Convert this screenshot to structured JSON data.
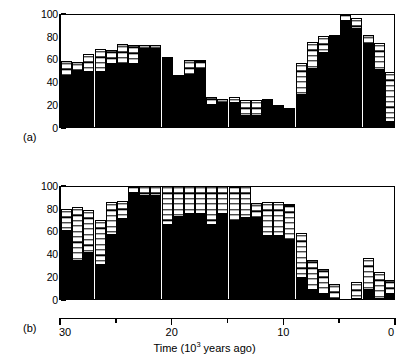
{
  "figure": {
    "axis_title_prefix": "Time (10",
    "axis_title_exponent": "3",
    "axis_title_suffix": " years ago)",
    "panel_a_tag": "(a)",
    "panel_b_tag": "(b)",
    "colors": {
      "solid": "#000000",
      "open": "#ffffff",
      "axis": "#000000",
      "background": "#ffffff"
    }
  },
  "chart_data": [
    {
      "type": "bar",
      "id": "panel-a",
      "title": "",
      "panel_label": "(a)",
      "xlabel": "Time (10^3 years ago)",
      "ylabel": "",
      "xlim": [
        30,
        0
      ],
      "ylim": [
        0,
        100
      ],
      "x_ticks_major": [
        30,
        20,
        10,
        0
      ],
      "x_ticks_minor": [
        25,
        15,
        5
      ],
      "y_ticks": [
        0,
        20,
        40,
        60,
        80,
        100
      ],
      "ytick_labels": [
        "0",
        "20",
        "40",
        "60",
        "80",
        "100"
      ],
      "grid": false,
      "legend": "none",
      "stacked": true,
      "bar_count": 30,
      "series": [
        {
          "name": "solid",
          "style": "filled-black",
          "values": [
            45,
            48,
            48,
            48,
            55,
            55,
            55,
            68,
            68,
            61,
            46,
            46,
            51,
            19,
            21,
            21,
            10,
            10,
            22,
            17,
            17,
            28,
            51,
            65,
            81,
            93,
            86,
            72,
            50,
            4
          ]
        },
        {
          "name": "open",
          "style": "white-with-horizontal-hatch",
          "values": [
            13,
            9,
            16,
            20,
            13,
            18,
            17,
            4,
            4,
            0,
            0,
            13,
            8,
            7,
            4,
            5,
            14,
            14,
            3,
            2,
            0,
            28,
            24,
            15,
            0,
            7,
            10,
            9,
            24,
            44
          ]
        },
        {
          "name": "total",
          "style": "stacked-top",
          "values": [
            58,
            57,
            64,
            68,
            68,
            73,
            72,
            72,
            72,
            61,
            46,
            59,
            59,
            26,
            25,
            26,
            24,
            24,
            25,
            19,
            17,
            56,
            75,
            80,
            81,
            100,
            96,
            81,
            74,
            48
          ]
        }
      ]
    },
    {
      "type": "bar",
      "id": "panel-b",
      "title": "",
      "panel_label": "(b)",
      "xlabel": "Time (10^3 years ago)",
      "ylabel": "",
      "xlim": [
        30,
        0
      ],
      "ylim": [
        0,
        100
      ],
      "x_ticks_major": [
        30,
        20,
        10,
        0
      ],
      "x_ticks_minor": [
        25,
        15,
        5
      ],
      "y_ticks": [
        0,
        20,
        40,
        60,
        80,
        100
      ],
      "ytick_labels": [
        "0",
        "20",
        "40",
        "60",
        "80",
        "100"
      ],
      "grid": false,
      "legend": "none",
      "stacked": true,
      "bar_count": 30,
      "series": [
        {
          "name": "solid",
          "style": "filled-black",
          "values": [
            60,
            33,
            40,
            30,
            56,
            70,
            93,
            90,
            90,
            65,
            72,
            75,
            75,
            65,
            75,
            68,
            71,
            71,
            55,
            55,
            52,
            18,
            8,
            4,
            0,
            0,
            0,
            8,
            0,
            4
          ]
        },
        {
          "name": "open",
          "style": "white-with-horizontal-hatch",
          "values": [
            19,
            48,
            38,
            39,
            29,
            16,
            7,
            10,
            10,
            35,
            28,
            25,
            25,
            35,
            25,
            32,
            29,
            13,
            30,
            30,
            31,
            40,
            26,
            22,
            13,
            0,
            15,
            28,
            24,
            13
          ]
        },
        {
          "name": "total",
          "style": "stacked-top",
          "values": [
            79,
            81,
            78,
            69,
            85,
            86,
            100,
            100,
            100,
            100,
            100,
            100,
            100,
            100,
            100,
            100,
            100,
            84,
            85,
            85,
            83,
            58,
            34,
            26,
            13,
            0,
            15,
            36,
            24,
            17
          ]
        }
      ]
    }
  ]
}
